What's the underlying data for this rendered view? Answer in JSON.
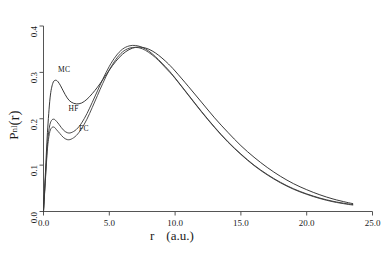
{
  "chart_data": {
    "type": "line",
    "title": "",
    "xlabel": "r   (a.u.)",
    "xlabel_symbol": "r",
    "xlabel_units": "(a.u.)",
    "ylabel": "P_nl(r)",
    "ylabel_base": "P",
    "ylabel_sub": "nl",
    "ylabel_arg": "(r)",
    "xlim": [
      0.0,
      25.0
    ],
    "ylim": [
      0.0,
      0.4
    ],
    "xticks": [
      0.0,
      5.0,
      10.0,
      15.0,
      20.0,
      25.0
    ],
    "xticklabels": [
      "0.0",
      "5.0",
      "10.0",
      "15.0",
      "20.0",
      "25.0"
    ],
    "yticks": [
      0.0,
      0.1,
      0.2,
      0.3,
      0.4
    ],
    "yticklabels": [
      "0.0",
      "0.1",
      "0.2",
      "0.3",
      "0.4"
    ],
    "grid": false,
    "legend_position": "inline-annotations",
    "annotations": [
      {
        "text": "MC",
        "x": 1.1,
        "y": 0.305
      },
      {
        "text": "HF",
        "x": 1.9,
        "y": 0.222
      },
      {
        "text": "FC",
        "x": 2.7,
        "y": 0.177
      }
    ],
    "series": [
      {
        "name": "MC",
        "color": "#222222",
        "x": [
          0.0,
          0.15,
          0.3,
          0.5,
          0.7,
          0.9,
          1.1,
          1.3,
          1.5,
          1.8,
          2.1,
          2.5,
          2.9,
          3.3,
          3.7,
          4.1,
          4.5,
          5.0,
          5.5,
          6.0,
          6.5,
          7.0,
          7.5,
          8.0,
          8.5,
          9.0,
          9.5,
          10.0,
          11.0,
          12.0,
          13.0,
          14.0,
          15.0,
          16.0,
          17.0,
          18.0,
          19.0,
          20.0,
          21.0,
          22.0,
          23.0,
          23.5
        ],
        "y": [
          0.0,
          0.085,
          0.17,
          0.245,
          0.276,
          0.283,
          0.28,
          0.271,
          0.26,
          0.245,
          0.236,
          0.232,
          0.234,
          0.242,
          0.254,
          0.268,
          0.284,
          0.305,
          0.324,
          0.339,
          0.349,
          0.354,
          0.354,
          0.35,
          0.342,
          0.331,
          0.318,
          0.303,
          0.27,
          0.236,
          0.202,
          0.171,
          0.142,
          0.117,
          0.095,
          0.076,
          0.06,
          0.047,
          0.036,
          0.027,
          0.02,
          0.017
        ]
      },
      {
        "name": "HF",
        "color": "#333333",
        "x": [
          0.0,
          0.15,
          0.3,
          0.45,
          0.6,
          0.8,
          1.0,
          1.2,
          1.5,
          1.8,
          2.1,
          2.5,
          2.9,
          3.3,
          3.7,
          4.1,
          4.5,
          5.0,
          5.5,
          6.0,
          6.5,
          7.0,
          7.5,
          8.0,
          8.5,
          9.0,
          9.5,
          10.0,
          11.0,
          12.0,
          13.0,
          14.0,
          15.0,
          16.0,
          17.0,
          18.0,
          19.0,
          20.0,
          21.0,
          22.0,
          23.0,
          23.5
        ],
        "y": [
          0.0,
          0.075,
          0.145,
          0.182,
          0.196,
          0.199,
          0.194,
          0.187,
          0.176,
          0.17,
          0.17,
          0.177,
          0.191,
          0.211,
          0.235,
          0.26,
          0.285,
          0.313,
          0.335,
          0.35,
          0.357,
          0.358,
          0.354,
          0.346,
          0.334,
          0.32,
          0.305,
          0.288,
          0.252,
          0.216,
          0.182,
          0.151,
          0.124,
          0.1,
          0.08,
          0.063,
          0.049,
          0.038,
          0.029,
          0.022,
          0.017,
          0.015
        ]
      },
      {
        "name": "FC",
        "color": "#3a3a3a",
        "x": [
          0.0,
          0.15,
          0.3,
          0.45,
          0.6,
          0.8,
          1.0,
          1.25,
          1.5,
          1.8,
          2.1,
          2.5,
          2.9,
          3.3,
          3.7,
          4.1,
          4.5,
          5.0,
          5.5,
          6.0,
          6.5,
          7.0,
          7.5,
          8.0,
          8.5,
          9.0,
          9.5,
          10.0,
          11.0,
          12.0,
          13.0,
          14.0,
          15.0,
          16.0,
          17.0,
          18.0,
          19.0,
          20.0,
          21.0,
          22.0,
          23.0,
          23.5
        ],
        "y": [
          0.0,
          0.07,
          0.135,
          0.168,
          0.18,
          0.182,
          0.176,
          0.168,
          0.16,
          0.155,
          0.156,
          0.164,
          0.179,
          0.199,
          0.224,
          0.25,
          0.276,
          0.305,
          0.328,
          0.344,
          0.352,
          0.354,
          0.351,
          0.343,
          0.332,
          0.318,
          0.303,
          0.287,
          0.251,
          0.215,
          0.181,
          0.15,
          0.123,
          0.099,
          0.079,
          0.062,
          0.048,
          0.037,
          0.028,
          0.021,
          0.016,
          0.014
        ]
      }
    ]
  },
  "axes": {
    "axis_color": "#555555",
    "tick_length": 4
  }
}
